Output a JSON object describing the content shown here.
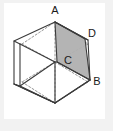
{
  "figure": {
    "kind": "geometry-diagram",
    "background_color": "#f2f2f2",
    "paper_color": "#ffffff",
    "line_color": "#3b3b3b",
    "hidden_line_color": "#7a7a7a",
    "shade_fill_color": "#b0b0b0",
    "label_color": "#1a1a1a",
    "solid": "cube",
    "projection": "isometric",
    "labels": {
      "a": "A",
      "b": "B",
      "c": "C",
      "d": "D"
    },
    "label_positions": {
      "a": {
        "x": 55,
        "y": 14
      },
      "b": {
        "x": 97,
        "y": 85
      },
      "c": {
        "x": 68,
        "y": 64
      },
      "d": {
        "x": 92,
        "y": 37
      }
    },
    "vertices": {
      "a": {
        "x": 55,
        "y": 22
      },
      "b": {
        "x": 90,
        "y": 80
      },
      "c": {
        "x": 57,
        "y": 62
      },
      "d": {
        "x": 85,
        "y": 39
      }
    },
    "shaded_region": {
      "name": "quadrilateral-ADBC",
      "points": "55,22 85,39 90,80 57,62"
    }
  }
}
